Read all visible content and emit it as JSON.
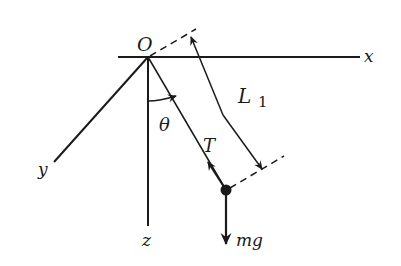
{
  "diagram": {
    "labels": {
      "origin": "O",
      "x_axis": "x",
      "y_axis": "y",
      "z_axis": "z",
      "length": "L",
      "length_subscript": "1",
      "angle": "θ",
      "tension": "T",
      "gravity": "mg"
    },
    "colors": {
      "ink": "#1a1a1a",
      "background": "#ffffff"
    }
  }
}
